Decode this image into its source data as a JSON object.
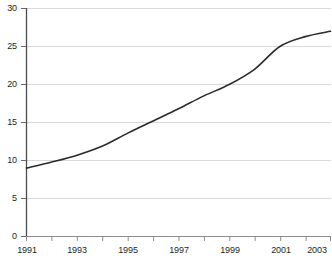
{
  "chart_data": {
    "type": "line",
    "title": "",
    "subtitle": "",
    "xlabel": "",
    "ylabel": "",
    "x": [
      1991,
      1992,
      1993,
      1994,
      1995,
      1996,
      1997,
      1998,
      1999,
      2000,
      2001,
      2002,
      2003
    ],
    "series": [
      {
        "name": "series-1",
        "values": [
          9.0,
          9.8,
          10.7,
          11.9,
          13.6,
          15.2,
          16.8,
          18.5,
          20.0,
          22.0,
          25.0,
          26.3,
          27.0
        ],
        "color": "#2b2b2b"
      }
    ],
    "xlim": [
      1991,
      2003
    ],
    "ylim": [
      0,
      30
    ],
    "x_ticks": [
      1991,
      1992,
      1993,
      1994,
      1995,
      1996,
      1997,
      1998,
      1999,
      2000,
      2001,
      2002,
      2003
    ],
    "x_tick_labels": [
      "1991",
      "",
      "1993",
      "",
      "1995",
      "",
      "1997",
      "",
      "1999",
      "",
      "2001",
      "",
      "2003"
    ],
    "y_ticks": [
      0,
      5,
      10,
      15,
      20,
      25,
      30
    ],
    "y_tick_labels": [
      "0",
      "5",
      "10",
      "15",
      "20",
      "25",
      "30"
    ],
    "grid": true,
    "grid_axis": "y",
    "grid_color": "#d9d9d9",
    "axis_color": "#555555",
    "legend": false,
    "legend_position": "none",
    "background_color": "#ffffff",
    "line_color": "#2b2b2b",
    "line_width": 1.6,
    "markers": false
  },
  "axes": {
    "y_labels": [
      "30",
      "25",
      "20",
      "15",
      "10",
      "5",
      "0"
    ],
    "x_labels": [
      "1991",
      "1993",
      "1995",
      "1997",
      "1999",
      "2001",
      "2003"
    ]
  }
}
